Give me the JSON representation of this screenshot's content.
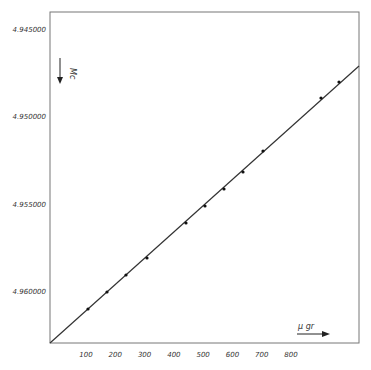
{
  "chart_data": {
    "type": "line",
    "title": "",
    "xlabel": "µgr",
    "ylabel": "Mc",
    "x_axis": {
      "ticks": [
        100,
        200,
        300,
        400,
        500,
        600,
        700,
        800
      ],
      "tick_labels": [
        "100",
        "200",
        "300",
        "400",
        "500",
        "600",
        "700",
        "800"
      ],
      "range": [
        0,
        900
      ],
      "direction_arrow": "right"
    },
    "y_axis": {
      "ticks": [
        4.945,
        4.95,
        4.955,
        4.96
      ],
      "tick_labels": [
        "4.945000",
        "4.950000",
        "4.955000",
        "4.960000"
      ],
      "range": [
        4.943,
        4.9629
      ],
      "inverted": true,
      "direction_arrow": "down"
    },
    "grid": false,
    "legend": null,
    "series": [
      {
        "name": "measured points",
        "style": "markers on straight fit line",
        "x": [
          105,
          170,
          235,
          305,
          440,
          505,
          570,
          635,
          700,
          900,
          960
        ],
        "y": [
          4.96097,
          4.96,
          4.95903,
          4.95806,
          4.95606,
          4.95509,
          4.95411,
          4.95314,
          4.95194,
          4.94891,
          4.948
        ]
      }
    ],
    "fit_line": {
      "from": {
        "x": 0,
        "y": 4.9629
      },
      "to": {
        "x": 1030,
        "y": 4.9468
      }
    }
  },
  "labels": {
    "x_unit": "µ gr",
    "y_unit": "Mc"
  }
}
